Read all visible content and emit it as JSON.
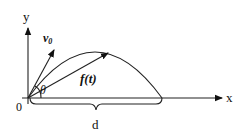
{
  "diagram": {
    "labels": {
      "y_axis": "y",
      "x_axis": "x",
      "origin": "0",
      "velocity": "v",
      "velocity_subscript": "0",
      "angle": "θ",
      "position_function": "f(t)",
      "distance": "d"
    },
    "elements": [
      {
        "name": "y-axis",
        "type": "arrow"
      },
      {
        "name": "x-axis",
        "type": "arrow"
      },
      {
        "name": "trajectory",
        "type": "parabola"
      },
      {
        "name": "initial-velocity-vector",
        "type": "arrow",
        "label": "v0"
      },
      {
        "name": "position-vector",
        "type": "arrow",
        "label": "f(t)"
      },
      {
        "name": "launch-angle",
        "type": "arc",
        "label": "θ"
      },
      {
        "name": "range-brace",
        "type": "brace",
        "label": "d"
      }
    ],
    "colors": {
      "ink": "#222222",
      "background": "#ffffff"
    }
  }
}
